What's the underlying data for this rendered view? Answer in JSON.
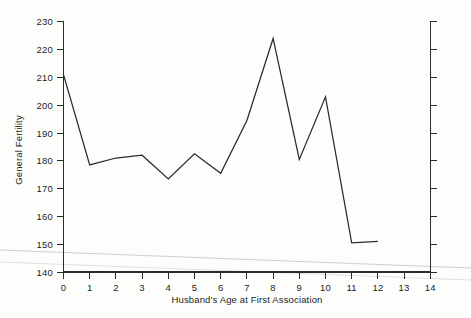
{
  "chart_data": {
    "type": "line",
    "title": "",
    "xlabel": "Husband's Age at First Association",
    "ylabel": "General Fertility",
    "x": [
      0,
      1,
      2,
      3,
      4,
      5,
      6,
      7,
      8,
      9,
      10,
      11,
      12
    ],
    "values": [
      211,
      178.5,
      181,
      182,
      173.5,
      182.5,
      175.5,
      194.5,
      224,
      180.5,
      203,
      150.5,
      151
    ],
    "series": [
      {
        "name": "General Fertility",
        "values": [
          211,
          178.5,
          181,
          182,
          173.5,
          182.5,
          175.5,
          194.5,
          224,
          180.5,
          203,
          150.5,
          151
        ]
      }
    ],
    "xlim": [
      0,
      14
    ],
    "ylim": [
      140,
      230
    ],
    "xticks": [
      0,
      1,
      2,
      3,
      4,
      5,
      6,
      7,
      8,
      9,
      10,
      11,
      12,
      13,
      14
    ],
    "yticks": [
      140,
      150,
      160,
      170,
      180,
      190,
      200,
      210,
      220,
      230
    ],
    "xtick_labels": [
      "0",
      "1",
      "2",
      "3",
      "4",
      "5",
      "6",
      "7",
      "8",
      "9",
      "10",
      "11",
      "12",
      "13",
      "14"
    ],
    "ytick_labels": [
      "140",
      "150",
      "160",
      "170",
      "180",
      "190",
      "200",
      "210",
      "220",
      "230"
    ],
    "grid": false,
    "legend": null,
    "line_color": "#2a2a2a",
    "axis_color": "#2b2b2b",
    "background_color": "#fdfdfc",
    "right_axis": {
      "present": true,
      "labels": [],
      "ticks": 10
    }
  }
}
